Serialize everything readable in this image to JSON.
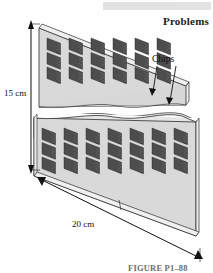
{
  "header": {
    "bar_ghost_text": "CHAPTER 1  INTRODUCTION",
    "bar_color": "#e3e3e3",
    "page_heading": "Problems"
  },
  "figure": {
    "caption": "FIGURE P1–88",
    "labels": {
      "height_dimension": "15 cm",
      "width_dimension": "20 cm",
      "callout": "Chips"
    },
    "colors": {
      "board_face": "#d9d9d9",
      "board_face_shaded": "#cfcfcf",
      "board_edge": "#f2f2f2",
      "chip_body": "#4d4d4d",
      "chip_fin": "#3a3a3a",
      "outline": "#1c1c1c",
      "leader_line": "#111111"
    },
    "geometry": {
      "boards": 2,
      "chip_columns_per_board": 6,
      "chips_per_column": 3,
      "total_chips_visible": 36,
      "projection": "isometric"
    }
  }
}
